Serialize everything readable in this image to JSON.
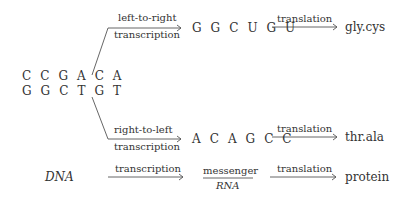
{
  "dna": {
    "top_strand": "C C G A C A",
    "bottom_strand": "G G C T G T"
  },
  "upper_branch": {
    "transcription_label_1": "left-to-right",
    "transcription_label_2": "transcription",
    "rna": "G G C U G U",
    "translation_label": "translation",
    "protein": "gly.cys"
  },
  "lower_branch": {
    "transcription_label_1": "right-to-left",
    "transcription_label_2": "transcription",
    "rna": "A C A G C C",
    "translation_label": "translation",
    "protein": "thr.ala"
  },
  "summary_row": {
    "source": "DNA",
    "transcription_label": "transcription",
    "intermediate_top": "messenger",
    "intermediate_bottom": "RNA",
    "translation_label": "translation",
    "product": "protein"
  }
}
